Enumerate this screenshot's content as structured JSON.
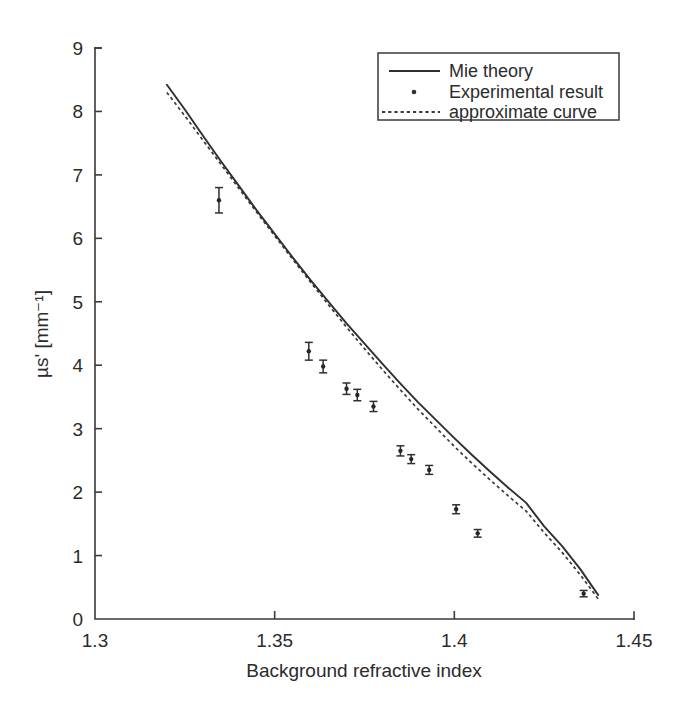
{
  "figure": {
    "background_color": "#ffffff",
    "ink_color": "#2f2f2f"
  },
  "chart_data": {
    "type": "line",
    "title": "",
    "subtitle": "",
    "xlabel": "Background refractive index",
    "ylabel": "µs' [mm⁻¹]",
    "xlim": [
      1.3,
      1.45
    ],
    "ylim": [
      0,
      9
    ],
    "xticks": [
      1.3,
      1.35,
      1.4,
      1.45
    ],
    "xtick_labels": [
      "1.3",
      "1.35",
      "1.4",
      "1.45"
    ],
    "yticks": [
      0,
      1,
      2,
      3,
      4,
      5,
      6,
      7,
      8,
      9
    ],
    "ytick_labels": [
      "0",
      "1",
      "2",
      "3",
      "4",
      "5",
      "6",
      "7",
      "8",
      "9"
    ],
    "grid": false,
    "legend_position": "top-right",
    "series": [
      {
        "name": "Mie theory",
        "style": "solid-line",
        "x": [
          1.32,
          1.325,
          1.33,
          1.335,
          1.34,
          1.345,
          1.35,
          1.355,
          1.36,
          1.365,
          1.37,
          1.375,
          1.38,
          1.385,
          1.39,
          1.395,
          1.4,
          1.405,
          1.41,
          1.415,
          1.42,
          1.425,
          1.43,
          1.435,
          1.44
        ],
        "y": [
          8.42,
          8.03,
          7.62,
          7.22,
          6.83,
          6.44,
          6.07,
          5.7,
          5.34,
          5.0,
          4.66,
          4.34,
          4.02,
          3.71,
          3.41,
          3.13,
          2.85,
          2.58,
          2.32,
          2.07,
          1.83,
          1.46,
          1.15,
          0.79,
          0.38
        ]
      },
      {
        "name": "approximate curve",
        "style": "dotted-line",
        "x": [
          1.32,
          1.325,
          1.33,
          1.335,
          1.34,
          1.345,
          1.35,
          1.355,
          1.36,
          1.365,
          1.37,
          1.375,
          1.38,
          1.385,
          1.39,
          1.395,
          1.4,
          1.405,
          1.41,
          1.415,
          1.42,
          1.425,
          1.43,
          1.435,
          1.44
        ],
        "y": [
          8.3,
          7.93,
          7.55,
          7.17,
          6.79,
          6.41,
          6.04,
          5.67,
          5.31,
          4.95,
          4.6,
          4.26,
          3.93,
          3.61,
          3.3,
          3.01,
          2.72,
          2.45,
          2.19,
          1.94,
          1.7,
          1.36,
          1.05,
          0.7,
          0.32
        ]
      },
      {
        "name": "Experimental result",
        "style": "points-with-errorbars",
        "x": [
          1.3345,
          1.3595,
          1.3635,
          1.37,
          1.373,
          1.3775,
          1.385,
          1.388,
          1.393,
          1.4005,
          1.4065,
          1.436
        ],
        "y": [
          6.6,
          4.22,
          3.98,
          3.63,
          3.53,
          3.35,
          2.65,
          2.52,
          2.35,
          1.73,
          1.35,
          0.4
        ],
        "yerr": [
          0.2,
          0.14,
          0.1,
          0.09,
          0.09,
          0.08,
          0.08,
          0.07,
          0.07,
          0.07,
          0.06,
          0.05
        ]
      }
    ],
    "legend_entries": [
      {
        "label": "Mie theory",
        "marker": "solid-line"
      },
      {
        "label": "Experimental result",
        "marker": "dot"
      },
      {
        "label": "approximate curve",
        "marker": "dotted-line"
      }
    ]
  }
}
